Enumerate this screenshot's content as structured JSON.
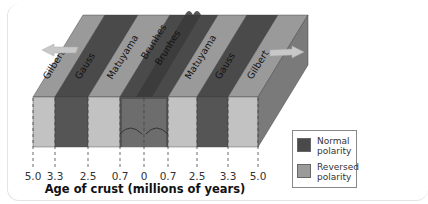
{
  "figure": {
    "colors": {
      "normal_top": "#4a4a4a",
      "normal_front": "#555555",
      "reversed_top": "#9a9a9a",
      "reversed_front": "#c2c2c2",
      "side_face": "#7a7a7a",
      "arrow": "#c8c8c8"
    },
    "stripes": [
      {
        "label": "Gilbert",
        "polarity": "reversed"
      },
      {
        "label": "Gauss",
        "polarity": "normal"
      },
      {
        "label": "Matuyama",
        "polarity": "reversed"
      },
      {
        "label": "Brunhes",
        "polarity": "normal"
      },
      {
        "label": "Brunhes",
        "polarity": "normal"
      },
      {
        "label": "Matuyama",
        "polarity": "reversed"
      },
      {
        "label": "Gauss",
        "polarity": "normal"
      },
      {
        "label": "Gilbert",
        "polarity": "reversed"
      }
    ],
    "axis": {
      "title": "Age of crust (millions of years)",
      "ticks": [
        "5.0",
        "3.3",
        "2.5",
        "0.7",
        "0",
        "0.7",
        "2.5",
        "3.3",
        "5.0"
      ]
    },
    "arrows": [
      {
        "direction": "left",
        "meaning": "spreading-left"
      },
      {
        "direction": "right",
        "meaning": "spreading-right"
      }
    ],
    "legend": {
      "items": [
        {
          "label_line1": "Normal",
          "label_line2": "polarity",
          "polarity": "normal"
        },
        {
          "label_line1": "Reversed",
          "label_line2": "polarity",
          "polarity": "reversed"
        }
      ]
    }
  }
}
